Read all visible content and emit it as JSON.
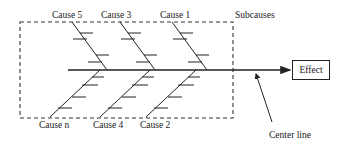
{
  "diagram": {
    "type": "fishbone (Ishikawa) cause-and-effect diagram",
    "top_causes": [
      {
        "label": "Cause 5"
      },
      {
        "label": "Cause 3"
      },
      {
        "label": "Cause 1"
      }
    ],
    "bottom_causes": [
      {
        "label": "Cause n"
      },
      {
        "label": "Cause 4"
      },
      {
        "label": "Cause 2"
      }
    ],
    "subcauses_label": "Subcauses",
    "effect_label": "Effect",
    "center_line_label": "Center line",
    "colors": {
      "line": "#222222",
      "background": "#ffffff"
    }
  }
}
